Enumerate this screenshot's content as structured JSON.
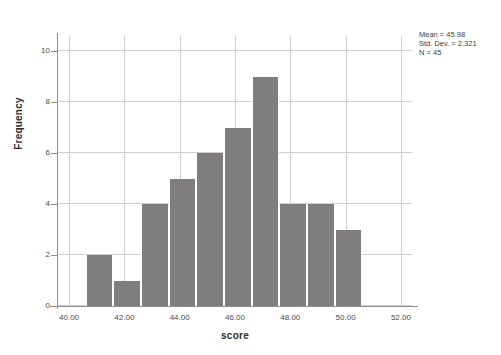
{
  "chart_data": {
    "type": "bar",
    "title": "",
    "xlabel": "score",
    "ylabel": "Frequency",
    "xlim": [
      39.6,
      52.4
    ],
    "ylim": [
      0,
      10.6
    ],
    "grid": true,
    "legend": "none",
    "bin_width": 1.0,
    "categories": [
      "40.6-41.6",
      "41.6-42.6",
      "42.6-43.6",
      "43.6-44.6",
      "44.6-45.6",
      "45.6-46.6",
      "46.6-47.6",
      "47.6-48.6",
      "48.6-49.6",
      "49.6-50.6"
    ],
    "bin_starts": [
      40.6,
      41.6,
      42.6,
      43.6,
      44.6,
      45.6,
      46.6,
      47.6,
      48.6,
      49.6
    ],
    "values": [
      2,
      1,
      4,
      5,
      6,
      7,
      9,
      4,
      4,
      3
    ],
    "x_ticks": [
      40,
      42,
      44,
      46,
      48,
      50,
      52
    ],
    "x_tick_labels": [
      "40.00",
      "42.00",
      "44.00",
      "46.00",
      "48.00",
      "50.00",
      "52.00"
    ],
    "y_ticks": [
      0,
      2,
      4,
      6,
      8,
      10
    ],
    "y_tick_labels": [
      "0",
      "2",
      "4",
      "6",
      "8",
      "10"
    ],
    "bar_color": "#807e7c",
    "grid_color": "#cfcfcf",
    "axis_color": "#8d8d8d"
  },
  "annotations": {
    "mean_line": "Mean = 45.98",
    "stddev_line": "Std. Dev. = 2.321",
    "n_line": "N = 45"
  }
}
